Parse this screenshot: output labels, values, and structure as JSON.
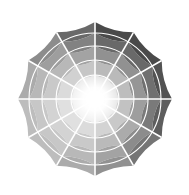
{
  "figure": {
    "background": "#ffffff",
    "width": 189,
    "height": 195
  },
  "chart_data": {
    "type": "pie",
    "subtype": "polar-sunburst-grayscale-color-wheel",
    "title": "",
    "subtitle": "",
    "xlabel": "",
    "ylabel": "",
    "grid": false,
    "legend": false,
    "legend_position": "none",
    "center_x": 95,
    "center_y": 99,
    "outer_radius": 77,
    "inner_radius": 0,
    "start_angle_deg": 90,
    "direction": "clockwise",
    "separator_color": "#ffffff",
    "separator_width": 1.6,
    "core_color": "#ffffff",
    "core_radius": 9,
    "n_wedges": 12,
    "n_rings": 5,
    "wedge_angle_deg": 30,
    "ring_radii": [
      9,
      24,
      39,
      53,
      66,
      77
    ],
    "ring_labels": [
      "ring-1-inner",
      "ring-2",
      "ring-3",
      "ring-4",
      "ring-5-outer"
    ],
    "categories": [
      "wedge-00-top",
      "wedge-01",
      "wedge-02",
      "wedge-03-right",
      "wedge-04",
      "wedge-05",
      "wedge-06-bottom",
      "wedge-07",
      "wedge-08",
      "wedge-09-left",
      "wedge-10",
      "wedge-11"
    ],
    "category_angles_deg": [
      0,
      30,
      60,
      90,
      120,
      150,
      180,
      210,
      240,
      270,
      300,
      330
    ],
    "series": [
      {
        "name": "ring-1-inner",
        "values": [
          88,
          88,
          88,
          89,
          90,
          92,
          93,
          94,
          94,
          93,
          91,
          89
        ],
        "colors": [
          "#e0e0e0",
          "#e0e0e0",
          "#e0e0e0",
          "#e3e3e3",
          "#e6e6e6",
          "#eaeaea",
          "#ededed",
          "#f0f0f0",
          "#f0f0f0",
          "#ededed",
          "#e8e8e8",
          "#e3e3e3"
        ]
      },
      {
        "name": "ring-2",
        "values": [
          73,
          73,
          74,
          76,
          79,
          83,
          86,
          88,
          88,
          86,
          82,
          77
        ],
        "colors": [
          "#bababa",
          "#bababa",
          "#bdbdbd",
          "#c2c2c2",
          "#c9c9c9",
          "#d3d3d3",
          "#dbdbdb",
          "#e0e0e0",
          "#e0e0e0",
          "#dbdbdb",
          "#d1d1d1",
          "#c6c6c6"
        ]
      },
      {
        "name": "ring-3",
        "values": [
          57,
          57,
          59,
          62,
          67,
          73,
          79,
          83,
          83,
          79,
          72,
          64
        ],
        "colors": [
          "#919191",
          "#919191",
          "#969696",
          "#9e9e9e",
          "#ababab",
          "#bababa",
          "#c9c9c9",
          "#d3d3d3",
          "#d3d3d3",
          "#c9c9c9",
          "#b8b8b8",
          "#a3a3a3"
        ]
      },
      {
        "name": "ring-4",
        "values": [
          41,
          41,
          44,
          48,
          55,
          64,
          72,
          78,
          78,
          72,
          62,
          51
        ],
        "colors": [
          "#696969",
          "#696969",
          "#707070",
          "#7a7a7a",
          "#8c8c8c",
          "#a3a3a3",
          "#b8b8b8",
          "#c7c7c7",
          "#c7c7c7",
          "#b8b8b8",
          "#9e9e9e",
          "#828282"
        ]
      },
      {
        "name": "ring-5-outer",
        "values": [
          29,
          29,
          32,
          37,
          46,
          57,
          67,
          74,
          74,
          67,
          55,
          41
        ],
        "colors": [
          "#4a4a4a",
          "#4a4a4a",
          "#525252",
          "#5e5e5e",
          "#757575",
          "#919191",
          "#ababab",
          "#bdbdbd",
          "#bdbdbd",
          "#ababab",
          "#8c8c8c",
          "#696969"
        ]
      }
    ],
    "value_label": "lightness",
    "value_unit": "%",
    "ylim": [
      0,
      100
    ]
  }
}
